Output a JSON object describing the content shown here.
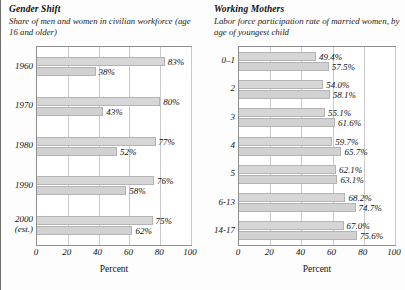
{
  "charts": [
    {
      "id": "gender-shift",
      "title": "Gender Shift",
      "subtitle": "Share of men and women in civilian workforce (age 16 and older)",
      "xlabel": "Percent",
      "chart_data": {
        "type": "bar",
        "orientation": "horizontal",
        "title": "Gender Shift",
        "subtitle": "Share of men and women in civilian workforce (age 16 and older)",
        "xlabel": "Percent",
        "ylabel": "",
        "xlim": [
          0,
          100
        ],
        "xticks": [
          0,
          20,
          40,
          60,
          80,
          100
        ],
        "grid": true,
        "legend": "none",
        "categories": [
          "1960",
          "1970",
          "1980",
          "1990",
          "2000 (est.)"
        ],
        "series": [
          {
            "name": "Men",
            "values": [
              83,
              80,
              77,
              76,
              75
            ],
            "labels": [
              "83%",
              "80%",
              "77%",
              "76%",
              "75%"
            ]
          },
          {
            "name": "Women",
            "values": [
              38,
              43,
              52,
              58,
              62
            ],
            "labels": [
              "38%",
              "43%",
              "52%",
              "58%",
              "62%"
            ]
          }
        ]
      },
      "ticklabels": [
        "0",
        "20",
        "40",
        "60",
        "80",
        "100"
      ],
      "groups": [
        {
          "cat": "1960",
          "cat2": "",
          "bars": [
            {
              "value": 83,
              "label": "83%"
            },
            {
              "value": 38,
              "label": "38%"
            }
          ]
        },
        {
          "cat": "1970",
          "cat2": "",
          "bars": [
            {
              "value": 80,
              "label": "80%"
            },
            {
              "value": 43,
              "label": "43%"
            }
          ]
        },
        {
          "cat": "1980",
          "cat2": "",
          "bars": [
            {
              "value": 77,
              "label": "77%"
            },
            {
              "value": 52,
              "label": "52%"
            }
          ]
        },
        {
          "cat": "1990",
          "cat2": "",
          "bars": [
            {
              "value": 76,
              "label": "76%"
            },
            {
              "value": 58,
              "label": "58%"
            }
          ]
        },
        {
          "cat": "2000",
          "cat2": "(est.)",
          "bars": [
            {
              "value": 75,
              "label": "75%"
            },
            {
              "value": 62,
              "label": "62%"
            }
          ]
        }
      ]
    },
    {
      "id": "working-mothers",
      "title": "Working Mothers",
      "subtitle": "Labor force participation rate of married women, by age of youngest child",
      "xlabel": "Percent",
      "chart_data": {
        "type": "bar",
        "orientation": "horizontal",
        "title": "Working Mothers",
        "subtitle": "Labor force participation rate of married women, by age of youngest child",
        "xlabel": "Percent",
        "ylabel": "",
        "xlim": [
          0,
          100
        ],
        "xticks": [
          0,
          20,
          40,
          60,
          80,
          100
        ],
        "grid": true,
        "legend": "none",
        "categories": [
          "0–1",
          "2",
          "3",
          "4",
          "5",
          "6-13",
          "14-17"
        ],
        "series": [
          {
            "name": "Earlier year",
            "values": [
              49.4,
              54.0,
              55.1,
              59.7,
              62.1,
              68.2,
              67.0
            ],
            "labels": [
              "49.4%",
              "54.0%",
              "55.1%",
              "59.7%",
              "62.1%",
              "68.2%",
              "67.0%"
            ]
          },
          {
            "name": "Later year",
            "values": [
              57.5,
              58.1,
              61.6,
              65.7,
              63.1,
              74.7,
              75.6
            ],
            "labels": [
              "57.5%",
              "58.1%",
              "61.6%",
              "65.7%",
              "63.1%",
              "74.7%",
              "75.6%"
            ]
          }
        ]
      },
      "ticklabels": [
        "0",
        "20",
        "40",
        "60",
        "80",
        "100"
      ],
      "groups": [
        {
          "cat": "0–1",
          "cat2": "",
          "bars": [
            {
              "value": 49.4,
              "label": "49.4%"
            },
            {
              "value": 57.5,
              "label": "57.5%"
            }
          ]
        },
        {
          "cat": "2",
          "cat2": "",
          "bars": [
            {
              "value": 54.0,
              "label": "54.0%"
            },
            {
              "value": 58.1,
              "label": "58.1%"
            }
          ]
        },
        {
          "cat": "3",
          "cat2": "",
          "bars": [
            {
              "value": 55.1,
              "label": "55.1%"
            },
            {
              "value": 61.6,
              "label": "61.6%"
            }
          ]
        },
        {
          "cat": "4",
          "cat2": "",
          "bars": [
            {
              "value": 59.7,
              "label": "59.7%"
            },
            {
              "value": 65.7,
              "label": "65.7%"
            }
          ]
        },
        {
          "cat": "5",
          "cat2": "",
          "bars": [
            {
              "value": 62.1,
              "label": "62.1%"
            },
            {
              "value": 63.1,
              "label": "63.1%"
            }
          ]
        },
        {
          "cat": "6-13",
          "cat2": "",
          "bars": [
            {
              "value": 68.2,
              "label": "68.2%"
            },
            {
              "value": 74.7,
              "label": "74.7%"
            }
          ]
        },
        {
          "cat": "14-17",
          "cat2": "",
          "bars": [
            {
              "value": 67.0,
              "label": "67.0%"
            },
            {
              "value": 75.6,
              "label": "75.6%"
            }
          ]
        }
      ]
    }
  ],
  "style": {
    "bar_fill": "#d6d6d6",
    "bar_stroke": "#b4b4b4",
    "grid_color": "#c9c9c9",
    "frame_color": "#8e8e8e",
    "text_color": "#111111"
  }
}
